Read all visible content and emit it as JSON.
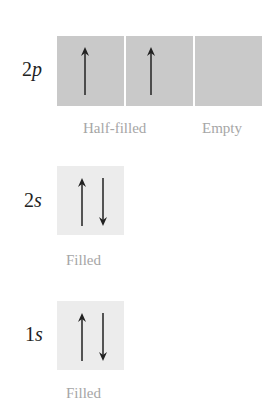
{
  "orbitals": [
    {
      "id": "2p",
      "number": "2",
      "letter": "p",
      "boxes": [
        {
          "electrons": [
            "up"
          ],
          "shade": "dark"
        },
        {
          "electrons": [
            "up"
          ],
          "shade": "dark"
        },
        {
          "electrons": [],
          "shade": "dark"
        }
      ],
      "captions": [
        "Half-filled",
        "Empty"
      ]
    },
    {
      "id": "2s",
      "number": "2",
      "letter": "s",
      "boxes": [
        {
          "electrons": [
            "up",
            "down"
          ],
          "shade": "light"
        }
      ],
      "captions": [
        "Filled"
      ]
    },
    {
      "id": "1s",
      "number": "1",
      "letter": "s",
      "boxes": [
        {
          "electrons": [
            "up",
            "down"
          ],
          "shade": "light"
        }
      ],
      "captions": [
        "Filled"
      ]
    }
  ],
  "colors": {
    "dark_box": "#c9c9c9",
    "light_box": "#ececec",
    "arrow": "#222222",
    "caption": "#a6a6a6"
  }
}
